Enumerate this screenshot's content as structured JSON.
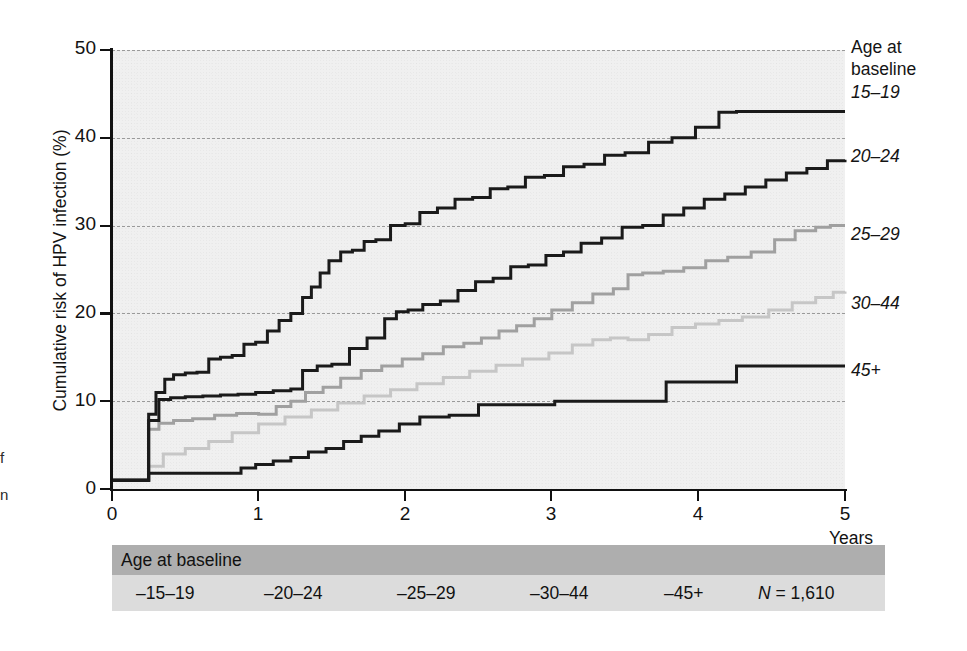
{
  "chart_data": {
    "type": "line",
    "title": "",
    "xlabel": "Years",
    "ylabel": "Cumulative risk of HPV infection (%)",
    "xlim": [
      0,
      5
    ],
    "ylim": [
      0,
      50
    ],
    "xticks": [
      "0",
      "1",
      "2",
      "3",
      "4",
      "5"
    ],
    "yticks": [
      "0",
      "10",
      "20",
      "30",
      "40",
      "50"
    ],
    "grid": "horizontal-dashed",
    "legend_position": "right",
    "legend_title": "Age at baseline",
    "step_style": "kaplan-meier step function",
    "series": [
      {
        "name": "15-19",
        "color": "#1a1a1a",
        "width": 3.0,
        "final_value": 43.0,
        "x": [
          0,
          0.22,
          0.25,
          0.3,
          0.36,
          0.42,
          0.5,
          0.58,
          0.66,
          0.74,
          0.82,
          0.9,
          0.98,
          1.06,
          1.14,
          1.22,
          1.3,
          1.36,
          1.42,
          1.48,
          1.56,
          1.64,
          1.72,
          1.8,
          1.9,
          2.0,
          2.1,
          2.22,
          2.34,
          2.46,
          2.58,
          2.7,
          2.82,
          2.95,
          3.08,
          3.22,
          3.36,
          3.5,
          3.66,
          3.82,
          3.98,
          4.14,
          4.26,
          5.0
        ],
        "y": [
          1.0,
          1.0,
          8.5,
          11.0,
          12.5,
          13.0,
          13.2,
          13.3,
          14.8,
          15.0,
          15.2,
          16.5,
          16.7,
          18.0,
          19.2,
          20.0,
          21.8,
          23.0,
          24.6,
          26.0,
          27.0,
          27.2,
          28.2,
          28.4,
          30.0,
          30.2,
          31.5,
          32.0,
          33.0,
          33.2,
          34.2,
          34.4,
          35.5,
          35.7,
          36.7,
          37.0,
          38.0,
          38.3,
          39.5,
          40.0,
          41.2,
          42.9,
          43.0,
          43.0
        ]
      },
      {
        "name": "20-24",
        "color": "#1a1a1a",
        "width": 3.0,
        "final_value": 37.5,
        "x": [
          0,
          0.22,
          0.25,
          0.32,
          0.4,
          0.5,
          0.62,
          0.74,
          0.86,
          0.98,
          1.1,
          1.22,
          1.3,
          1.4,
          1.5,
          1.62,
          1.74,
          1.86,
          1.94,
          2.02,
          2.12,
          2.24,
          2.36,
          2.48,
          2.6,
          2.72,
          2.84,
          2.96,
          3.08,
          3.2,
          3.34,
          3.48,
          3.62,
          3.76,
          3.9,
          4.04,
          4.18,
          4.32,
          4.46,
          4.6,
          4.74,
          4.88,
          5.0
        ],
        "y": [
          1.0,
          1.0,
          7.8,
          10.2,
          10.4,
          10.5,
          10.6,
          10.7,
          10.8,
          11.0,
          11.2,
          11.4,
          13.5,
          14.0,
          14.2,
          16.0,
          17.2,
          19.4,
          20.2,
          20.4,
          21.0,
          21.4,
          22.6,
          23.6,
          24.0,
          25.3,
          25.5,
          26.6,
          27.0,
          28.0,
          28.6,
          29.8,
          30.0,
          31.2,
          32.0,
          33.0,
          33.6,
          34.4,
          35.2,
          36.0,
          36.5,
          37.4,
          37.5
        ]
      },
      {
        "name": "25-29",
        "color": "#a0a0a0",
        "width": 3.0,
        "final_value": 30.0,
        "x": [
          0,
          0.22,
          0.25,
          0.32,
          0.42,
          0.55,
          0.7,
          0.85,
          1.0,
          1.12,
          1.22,
          1.32,
          1.44,
          1.56,
          1.7,
          1.84,
          1.98,
          2.12,
          2.26,
          2.4,
          2.52,
          2.64,
          2.76,
          2.88,
          3.0,
          3.14,
          3.28,
          3.42,
          3.52,
          3.62,
          3.76,
          3.9,
          4.05,
          4.2,
          4.36,
          4.52,
          4.66,
          4.8,
          4.9,
          5.0
        ],
        "y": [
          1.0,
          1.0,
          6.8,
          7.5,
          7.8,
          8.0,
          8.4,
          8.6,
          8.5,
          9.4,
          10.0,
          11.0,
          11.6,
          12.6,
          13.5,
          14.0,
          14.8,
          15.4,
          16.2,
          16.6,
          17.2,
          18.0,
          18.6,
          19.4,
          20.4,
          21.2,
          22.2,
          22.8,
          24.4,
          24.6,
          24.8,
          25.2,
          26.0,
          26.4,
          27.0,
          28.4,
          29.4,
          29.8,
          30.0,
          30.0
        ]
      },
      {
        "name": "30-44",
        "color": "#c6c6c6",
        "width": 3.0,
        "final_value": 22.5,
        "x": [
          0,
          0.22,
          0.25,
          0.35,
          0.5,
          0.66,
          0.82,
          1.0,
          1.18,
          1.36,
          1.54,
          1.72,
          1.9,
          2.08,
          2.26,
          2.44,
          2.62,
          2.8,
          2.98,
          3.14,
          3.28,
          3.4,
          3.52,
          3.66,
          3.82,
          3.98,
          4.14,
          4.3,
          4.48,
          4.64,
          4.8,
          4.92,
          5.0
        ],
        "y": [
          1.0,
          1.0,
          2.6,
          4.0,
          4.6,
          5.4,
          6.4,
          7.4,
          8.2,
          9.0,
          9.8,
          10.6,
          11.3,
          12.0,
          12.7,
          13.4,
          14.1,
          14.8,
          15.5,
          16.4,
          17.0,
          17.2,
          17.0,
          17.6,
          18.4,
          18.8,
          19.2,
          19.6,
          20.4,
          21.2,
          21.8,
          22.4,
          22.5
        ]
      },
      {
        "name": "45+",
        "color": "#1a1a1a",
        "width": 3.0,
        "final_value": 14.0,
        "x": [
          0,
          0.22,
          0.25,
          0.8,
          0.88,
          0.98,
          1.1,
          1.22,
          1.34,
          1.46,
          1.58,
          1.7,
          1.82,
          1.96,
          2.1,
          2.3,
          2.5,
          3.0,
          3.02,
          3.76,
          3.78,
          4.24,
          4.26,
          5.0
        ],
        "y": [
          1.0,
          1.0,
          1.8,
          1.8,
          2.4,
          2.8,
          3.2,
          3.6,
          4.2,
          4.6,
          5.4,
          6.0,
          6.6,
          7.4,
          8.2,
          8.4,
          9.6,
          9.6,
          10.0,
          10.0,
          12.2,
          12.2,
          14.0,
          14.0
        ]
      }
    ]
  },
  "axis": {
    "y_title": "Cumulative risk of HPV infection (%)",
    "x_title": "Years",
    "y_ticks": [
      "50",
      "40",
      "30",
      "20",
      "10",
      "0"
    ],
    "x_ticks": [
      "0",
      "1",
      "2",
      "3",
      "4",
      "5"
    ]
  },
  "legend": {
    "title_line1": "Age at",
    "title_line2": "baseline",
    "items": [
      {
        "label": "15–19"
      },
      {
        "label": "20–24"
      },
      {
        "label": "25–29"
      },
      {
        "label": "30–44"
      },
      {
        "label": "45+"
      }
    ]
  },
  "table": {
    "header": "Age at baseline",
    "cells": [
      {
        "label": "–15–19"
      },
      {
        "label": "–20–24"
      },
      {
        "label": "–25–29"
      },
      {
        "label": "–30–44"
      },
      {
        "label": "–45+"
      }
    ],
    "n_prefix": "N",
    "n_value": "= 1,610"
  },
  "margin_fragments": {
    "frag1": "f",
    "frag2": "n"
  },
  "colors": {
    "plot_background": "#f0f0f0",
    "grid": "#9a9a9a",
    "axis": "#111111",
    "table_header_bg": "#aeaeae",
    "table_body_bg": "#dcdcdc",
    "series_dark": "#1a1a1a",
    "series_medium": "#a0a0a0",
    "series_light": "#c6c6c6"
  }
}
